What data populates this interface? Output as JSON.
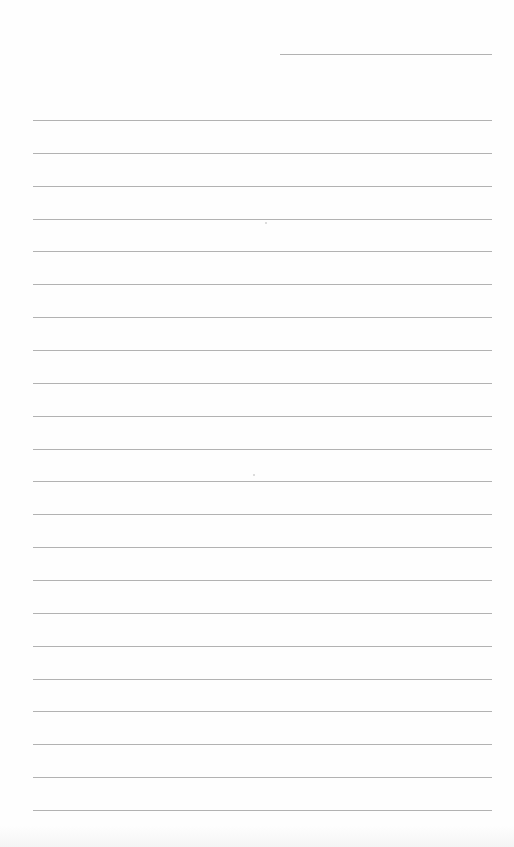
{
  "page": {
    "type": "lined-notebook-page",
    "background_color": "#fefefe",
    "line_color": "#b2b2b2",
    "header_line": {
      "label": "",
      "x": 280,
      "y": 54,
      "width": 212
    },
    "ruled_lines": {
      "count": 22,
      "start_y": 120,
      "spacing": 32.86,
      "x": 33,
      "width": 459,
      "texts": [
        "",
        "",
        "",
        "",
        "",
        "",
        "",
        "",
        "",
        "",
        "",
        "",
        "",
        "",
        "",
        "",
        "",
        "",
        "",
        "",
        "",
        ""
      ]
    },
    "specks": [
      {
        "x": 265,
        "y": 222
      },
      {
        "x": 253,
        "y": 474
      }
    ]
  }
}
